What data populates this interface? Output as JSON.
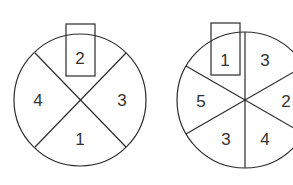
{
  "diagram": {
    "stroke_color": "#2b2b2b",
    "wheels": [
      {
        "name": "wheel-four-sectors",
        "sectors": 4,
        "selected_label": "2",
        "labels": {
          "top": "2",
          "right": "3",
          "bottom": "1",
          "left": "4"
        }
      },
      {
        "name": "wheel-six-sectors",
        "sectors": 6,
        "selected_label": "1",
        "labels": {
          "top_left": "1",
          "top_right": "3",
          "right": "2",
          "bottom_right": "4",
          "bottom_left": "3",
          "left": "5"
        }
      }
    ]
  }
}
